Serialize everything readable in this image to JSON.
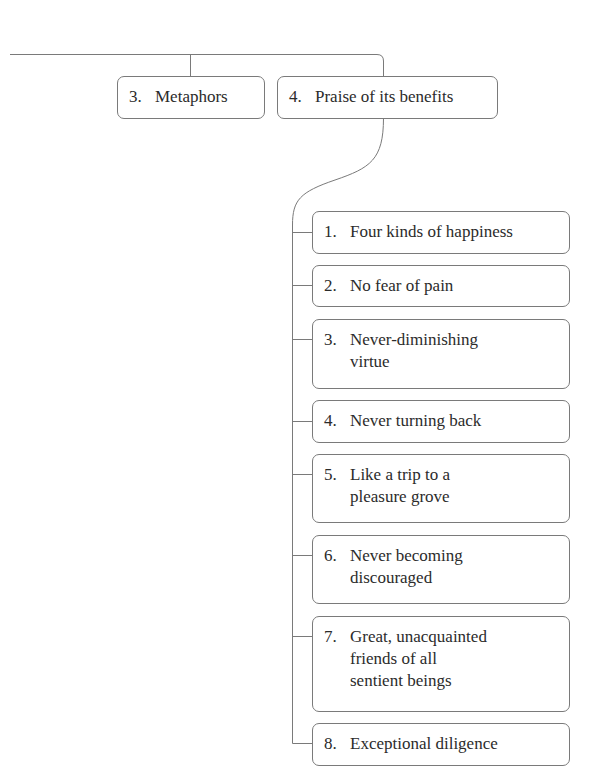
{
  "diagram": {
    "top_level": [
      {
        "number": "3.",
        "label": "Metaphors"
      },
      {
        "number": "4.",
        "label": "Praise of its benefits"
      }
    ],
    "children_of_4": [
      {
        "number": "1.",
        "label": "Four kinds of happiness"
      },
      {
        "number": "2.",
        "label": "No fear of pain"
      },
      {
        "number": "3.",
        "label": "Never-diminishing\nvirtue"
      },
      {
        "number": "4.",
        "label": "Never turning back"
      },
      {
        "number": "5.",
        "label": "Like a trip to a\npleasure grove"
      },
      {
        "number": "6.",
        "label": "Never becoming\ndiscouraged"
      },
      {
        "number": "7.",
        "label": "Great, unacquainted\nfriends of all\nsentient beings"
      },
      {
        "number": "8.",
        "label": "Exceptional diligence"
      }
    ]
  },
  "colors": {
    "line": "#7a7a7a",
    "text": "#2b2b2b",
    "background": "#ffffff"
  }
}
